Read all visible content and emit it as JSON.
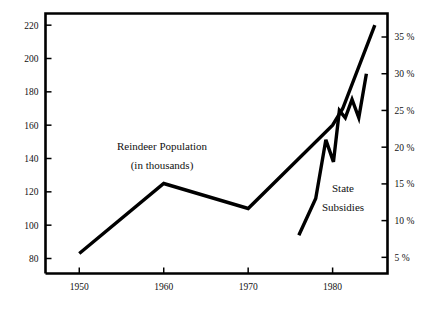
{
  "chart_data": {
    "type": "line",
    "title": "",
    "subtitle": "",
    "xlabel": "",
    "ylabel": "Reindeer Population (in thousands)",
    "y2label": "State Subsidies",
    "grid": false,
    "legend_position": "inline-annotation",
    "xlim": [
      1946,
      1986.5
    ],
    "xticks": [
      1950,
      1960,
      1970,
      1980
    ],
    "xtick_labels": [
      "1950",
      "1960",
      "1970",
      "1980"
    ],
    "ylim": [
      71,
      227
    ],
    "yticks": [
      80,
      100,
      120,
      140,
      160,
      180,
      200,
      220
    ],
    "ytick_labels": [
      "80",
      "100",
      "120",
      "140",
      "160",
      "180",
      "200",
      "220"
    ],
    "y2lim": [
      2.8,
      38.2
    ],
    "y2ticks": [
      5,
      10,
      15,
      20,
      25,
      30,
      35
    ],
    "y2tick_labels": [
      "5 %",
      "10 %",
      "15 %",
      "20 %",
      "25 %",
      "30 %",
      "35 %"
    ],
    "series": [
      {
        "name": "Reindeer Population",
        "axis": "left",
        "units": "thousands",
        "annotation_lines": [
          "Reindeer Population",
          "(in thousands)"
        ],
        "x": [
          1950,
          1960,
          1970,
          1980,
          1981.2,
          1985
        ],
        "values": [
          83,
          125,
          110,
          160,
          170,
          220
        ]
      },
      {
        "name": "State Subsidies",
        "axis": "right",
        "units": "percent",
        "annotation_lines": [
          "State",
          "Subsidies"
        ],
        "x": [
          1976,
          1978,
          1979.2,
          1980.1,
          1980.8,
          1981.5,
          1982.3,
          1983.1,
          1984
        ],
        "values": [
          8,
          13,
          21,
          18,
          25,
          24,
          26.5,
          24,
          30
        ]
      }
    ]
  },
  "annotations": {
    "population_line1": "Reindeer Population",
    "population_line2": "(in thousands)",
    "subsidies_line1": "State",
    "subsidies_line2": "Subsidies"
  },
  "axes": {
    "left_ticks": [
      "220",
      "200",
      "180",
      "160",
      "140",
      "120",
      "100",
      "80"
    ],
    "right_ticks": [
      "35 %",
      "30 %",
      "25 %",
      "20 %",
      "15 %",
      "10 %",
      "5 %"
    ],
    "bottom_ticks": [
      "1950",
      "1960",
      "1970",
      "1980"
    ]
  },
  "colors": {
    "ink": "#000000",
    "background": "#ffffff"
  }
}
